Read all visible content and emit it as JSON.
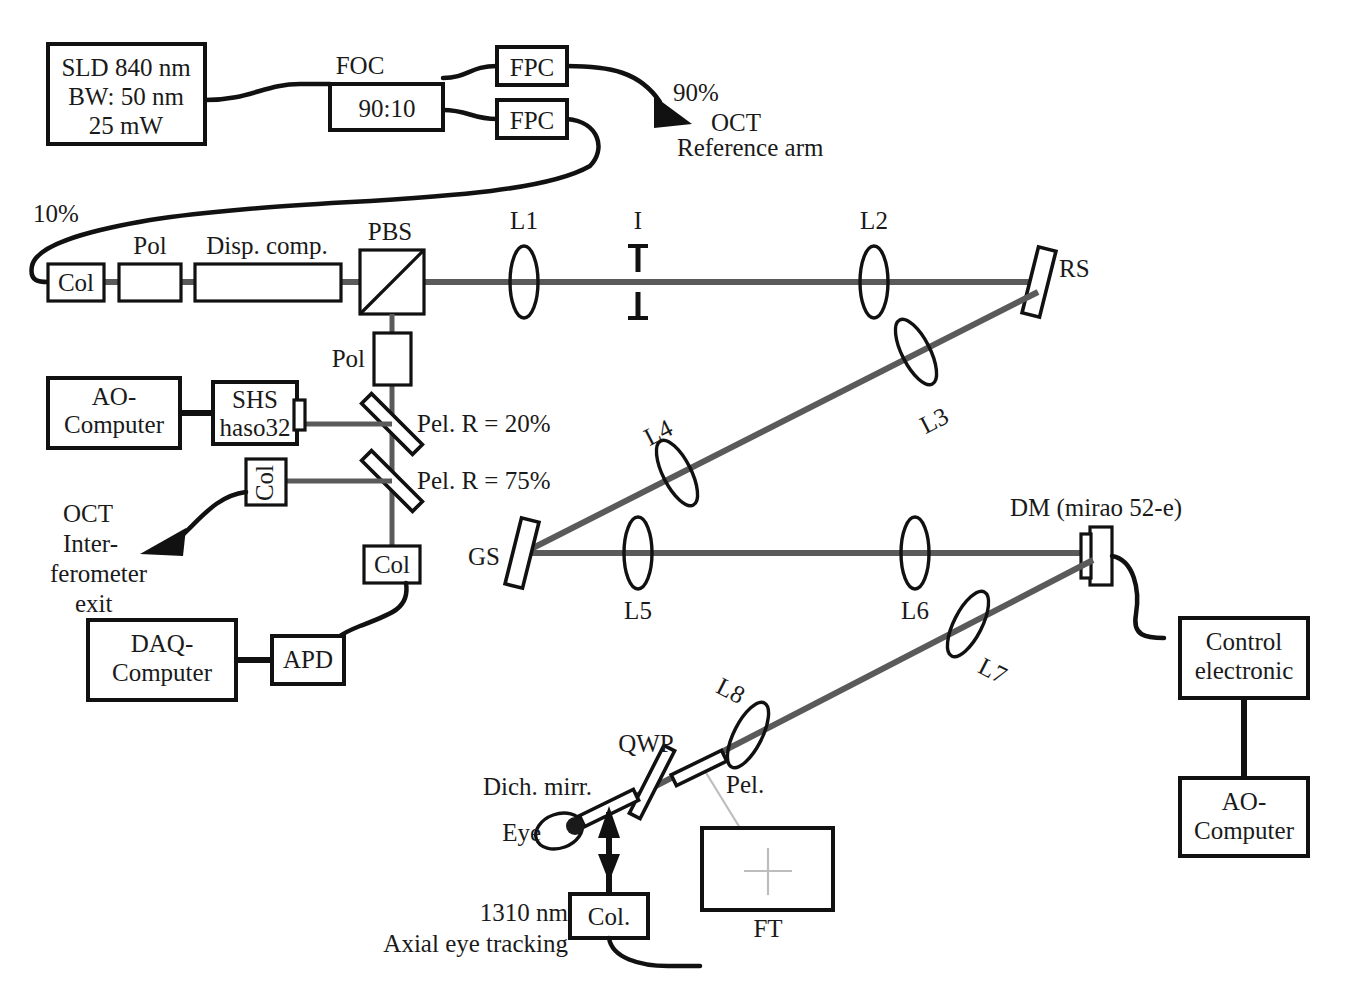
{
  "figure": {
    "beam_color": "#5a5a5a",
    "line_color": "#111111",
    "faint_color": "#bdbdbd"
  },
  "source": {
    "line1": "SLD 840 nm",
    "line2": "BW: 50 nm",
    "line3": "25 mW"
  },
  "coupler": {
    "name": "FOC",
    "ratio": "90:10",
    "fpc_top": "FPC",
    "fpc_bottom": "FPC"
  },
  "split": {
    "pct_90": "90%",
    "pct_10": "10%",
    "oct_ref_line1": "OCT",
    "oct_ref_line2": "Reference arm"
  },
  "sample_arm": {
    "col": "Col",
    "pol": "Pol",
    "disp_comp": "Disp. comp.",
    "pbs": "PBS",
    "l1": "L1",
    "iris": "I",
    "l2": "L2",
    "rs": "RS",
    "l3": "L3",
    "l4": "L4",
    "gs": "GS",
    "l5": "L5",
    "l6": "L6",
    "l7": "L7",
    "l8": "L8"
  },
  "wavefront_branch": {
    "pol": "Pol",
    "ao_computer_line1": "AO-",
    "ao_computer_line2": "Computer",
    "shs_line1": "SHS",
    "shs_line2": "haso32",
    "pel20": "Pel. R = 20%",
    "pel75": "Pel. R = 75%",
    "col_ref": "Col",
    "col_det": "Col"
  },
  "oct_exit": {
    "line1": "OCT",
    "line2": "Inter-",
    "line3": "ferometer",
    "line4": "exit"
  },
  "detection": {
    "daq_line1": "DAQ-",
    "daq_line2": "Computer",
    "apd": "APD"
  },
  "deformable_mirror": {
    "label": "DM (mirao 52-e)",
    "control_line1": "Control",
    "control_line2": "electronic",
    "ao_computer_line1": "AO-",
    "ao_computer_line2": "Computer"
  },
  "eye_section": {
    "eye": "Eye",
    "dich_mirror": "Dich. mirr.",
    "qwp": "QWP",
    "pel": "Pel.",
    "col": "Col.",
    "ft": "FT",
    "tracking_line1": "1310 nm",
    "tracking_line2": "Axial eye tracking"
  }
}
